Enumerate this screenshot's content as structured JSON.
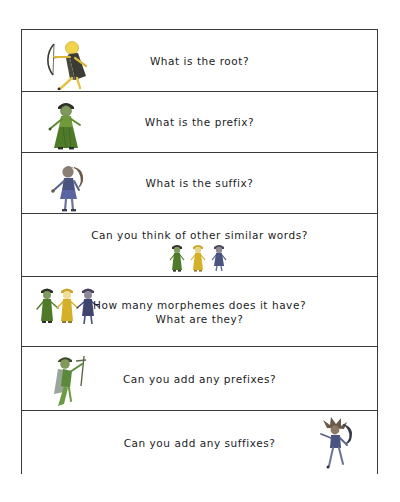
{
  "page": {
    "background_color": "#ffffff"
  },
  "worksheet": {
    "border_color": "#3a3a3a",
    "fill_color": "#ffffff",
    "rows": [
      {
        "id": "row-root",
        "text": "What is the root?",
        "figure": "archer-gold-figure",
        "figure_position": "left",
        "figure_colors": [
          "#e8c23a",
          "#3a3a34",
          "#f0d98a"
        ]
      },
      {
        "id": "row-prefix",
        "text": "What is the prefix?",
        "figure": "green-gown-figure",
        "figure_position": "left",
        "figure_colors": [
          "#4f7a2a",
          "#6f9a3a",
          "#2e2e2e"
        ]
      },
      {
        "id": "row-suffix",
        "text": "What is the suffix?",
        "figure": "blue-ponytail-figure",
        "figure_position": "left",
        "figure_colors": [
          "#4a5480",
          "#6d6480",
          "#6a5a4a"
        ]
      },
      {
        "id": "row-similar-words",
        "text": "Can you think of other similar words?",
        "figure": "three-figures-group",
        "figure_position": "center",
        "figure_colors": [
          "#4f7a2a",
          "#d4b02a",
          "#4a5480"
        ]
      },
      {
        "id": "row-morphemes",
        "text": "How many morphemes does it have?\nWhat are they?",
        "figure": "three-figures-holding-hands",
        "figure_position": "left",
        "figure_colors": [
          "#4f7a2a",
          "#d4b02a",
          "#3e4670"
        ]
      },
      {
        "id": "row-add-prefixes",
        "text": "Can you add any prefixes?",
        "figure": "green-cape-staff-figure",
        "figure_position": "left",
        "figure_colors": [
          "#5b8a3a",
          "#8a9a8a",
          "#3a3a3a"
        ]
      },
      {
        "id": "row-add-suffixes",
        "text": "Can you add any suffixes?",
        "figure": "navy-spiky-figure",
        "figure_position": "right",
        "figure_colors": [
          "#4a5480",
          "#6a5a4a",
          "#2e2e3a"
        ]
      }
    ]
  }
}
